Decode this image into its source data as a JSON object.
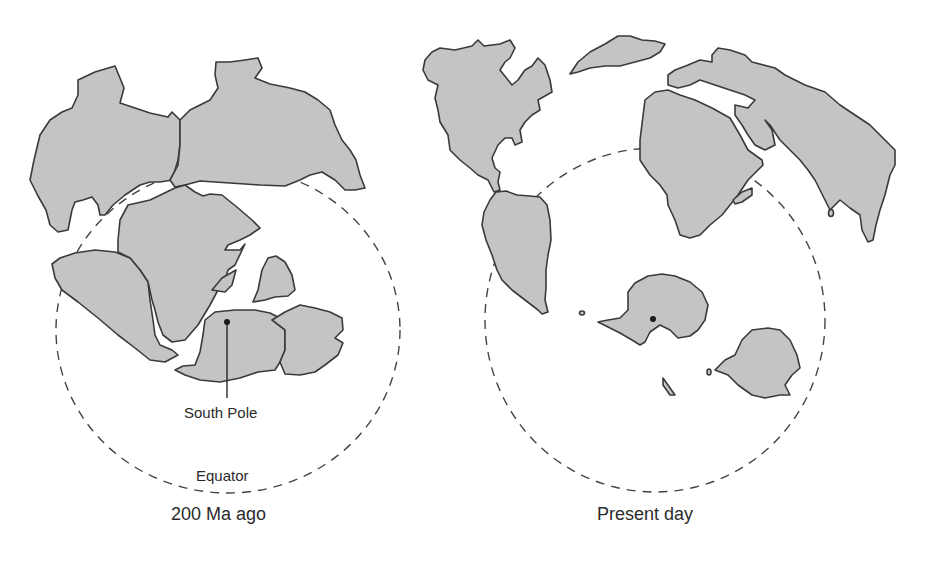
{
  "figure": {
    "panels": [
      {
        "id": "past",
        "caption": "200 Ma ago",
        "annotations": {
          "pole_label": "South Pole",
          "equator_label": "Equator"
        }
      },
      {
        "id": "present",
        "caption": "Present day"
      }
    ],
    "colors": {
      "land_fill": "#c4c4c4",
      "outline": "#3a3a3a",
      "background": "#ffffff"
    }
  }
}
